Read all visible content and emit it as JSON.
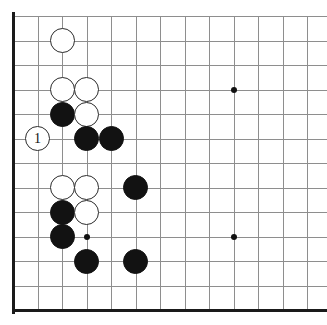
{
  "figure": {
    "board_label": "go-board",
    "width": 327,
    "height": 325
  },
  "board": {
    "origin_x": 13,
    "origin_y": 16,
    "spacing": 24.5,
    "cols_visible": 13,
    "rows_visible": 13,
    "line_color": "#8e8e8e",
    "border_color": "#1a1a1a",
    "background_color": "#ffffff",
    "black_color": "#121212",
    "white_color": "#ffffff",
    "white_outline_color": "#2b2b2b",
    "border_left_width": 3,
    "border_bottom_width": 3
  },
  "star_points": [
    {
      "name": "star-point-upper",
      "col": 9,
      "row": 3
    },
    {
      "name": "star-point-lower-right",
      "col": 9,
      "row": 9
    },
    {
      "name": "star-point-lower-left",
      "col": 3,
      "row": 9
    }
  ],
  "stones": [
    {
      "name": "white-stone-c2",
      "color": "white",
      "col": 2,
      "row": 1,
      "label": ""
    },
    {
      "name": "white-stone-c2r3",
      "color": "white",
      "col": 2,
      "row": 3,
      "label": ""
    },
    {
      "name": "white-stone-c3r3",
      "color": "white",
      "col": 3,
      "row": 3,
      "label": ""
    },
    {
      "name": "black-stone-c2r4",
      "color": "black",
      "col": 2,
      "row": 4,
      "label": ""
    },
    {
      "name": "white-stone-c3r4",
      "color": "white",
      "col": 3,
      "row": 4,
      "label": ""
    },
    {
      "name": "white-stone-move-1",
      "color": "marker",
      "col": 1,
      "row": 5,
      "label": "1"
    },
    {
      "name": "black-stone-c3r5",
      "color": "black",
      "col": 3,
      "row": 5,
      "label": ""
    },
    {
      "name": "black-stone-c4r5",
      "color": "black",
      "col": 4,
      "row": 5,
      "label": ""
    },
    {
      "name": "white-stone-c2r7",
      "color": "white",
      "col": 2,
      "row": 7,
      "label": ""
    },
    {
      "name": "white-stone-c3r7",
      "color": "white",
      "col": 3,
      "row": 7,
      "label": ""
    },
    {
      "name": "black-stone-c5r7",
      "color": "black",
      "col": 5,
      "row": 7,
      "label": ""
    },
    {
      "name": "black-stone-c2r8",
      "color": "black",
      "col": 2,
      "row": 8,
      "label": ""
    },
    {
      "name": "white-stone-c3r8",
      "color": "white",
      "col": 3,
      "row": 8,
      "label": ""
    },
    {
      "name": "black-stone-c2r9",
      "color": "black",
      "col": 2,
      "row": 9,
      "label": ""
    },
    {
      "name": "black-stone-c3r10",
      "color": "black",
      "col": 3,
      "row": 10,
      "label": ""
    },
    {
      "name": "black-stone-c5r10",
      "color": "black",
      "col": 5,
      "row": 10,
      "label": ""
    }
  ],
  "annotations": {
    "move_number_1": "1"
  }
}
